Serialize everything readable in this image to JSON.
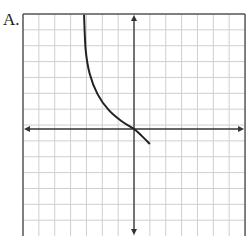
{
  "label": "A.",
  "graph": {
    "grid": {
      "cols": 14,
      "rows": 14,
      "cell_px": 15.86,
      "origin_px": [
        23,
        14
      ],
      "grid_color": "#cfcfcf",
      "border_color": "#555555"
    },
    "axes": {
      "x_axis_row": 7.25,
      "y_axis_col": 7,
      "color": "#333333"
    },
    "curve": {
      "description": "decreasing curve, vertical asymptote near x=-3, passing through origin, ending at (1,-1)",
      "color": "#222222",
      "points_grid_units": [
        [
          -3.15,
          7.2
        ],
        [
          -3.05,
          5
        ],
        [
          -2.8,
          3.5
        ],
        [
          -2.3,
          2.2
        ],
        [
          -1.6,
          1.2
        ],
        [
          -0.8,
          0.5
        ],
        [
          0,
          0
        ],
        [
          0.5,
          -0.45
        ],
        [
          1,
          -0.95
        ]
      ]
    }
  }
}
